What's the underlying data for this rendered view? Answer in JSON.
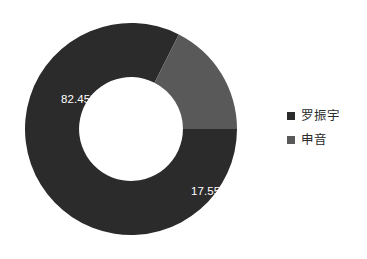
{
  "chart_data": {
    "type": "pie",
    "variant": "donut",
    "title": "",
    "subtitle": "",
    "xlabel": "",
    "ylabel": "",
    "grid": false,
    "legend_position": "right",
    "hole_ratio": 0.49,
    "start_angle_deg": 90,
    "direction": "clockwise",
    "categories": [
      "罗振宇",
      "申音"
    ],
    "values": [
      82.45,
      17.55
    ],
    "value_unit": "%",
    "data_labels": [
      "82.45%",
      "17.55%"
    ],
    "colors": [
      "#2b2b2b",
      "#595959"
    ],
    "slices": [
      {
        "name": "罗振宇",
        "value": 82.45,
        "label": "82.45%",
        "color": "#2b2b2b",
        "label_color": "#ffffff"
      },
      {
        "name": "申音",
        "value": 17.55,
        "label": "17.55%",
        "color": "#595959",
        "label_color": "#ffffff"
      }
    ]
  },
  "legend": {
    "items": [
      {
        "label": "罗振宇",
        "color": "#2b2b2b",
        "marker": "square-marker-icon"
      },
      {
        "label": "申音",
        "color": "#595959",
        "marker": "square-marker-icon"
      }
    ]
  },
  "canvas": {
    "background": "#ffffff"
  }
}
